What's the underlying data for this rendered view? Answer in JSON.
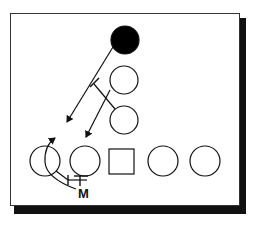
{
  "diagram": {
    "type": "football-play-diagram",
    "colors": {
      "line": "#111111",
      "fill_defender": "#000000",
      "background": "#ffffff",
      "shadow": "#111111"
    },
    "label_m": "M",
    "players": [
      {
        "id": "defender-filled",
        "shape": "circle",
        "filled": true,
        "cx": 125,
        "cy": 40,
        "r": 14
      },
      {
        "id": "offense-upper",
        "shape": "circle",
        "filled": false,
        "cx": 124,
        "cy": 80,
        "r": 14
      },
      {
        "id": "offense-middle",
        "shape": "circle",
        "filled": false,
        "cx": 124,
        "cy": 120,
        "r": 14
      },
      {
        "id": "line-1",
        "shape": "circle",
        "filled": false,
        "cx": 45,
        "cy": 161,
        "r": 15
      },
      {
        "id": "line-2",
        "shape": "circle",
        "filled": false,
        "cx": 85,
        "cy": 161,
        "r": 15
      },
      {
        "id": "center",
        "shape": "square",
        "filled": false,
        "x": 109,
        "y": 149,
        "size": 25
      },
      {
        "id": "line-4",
        "shape": "circle",
        "filled": false,
        "cx": 163,
        "cy": 161,
        "r": 15
      },
      {
        "id": "line-5",
        "shape": "circle",
        "filled": false,
        "cx": 205,
        "cy": 161,
        "r": 15
      }
    ]
  }
}
